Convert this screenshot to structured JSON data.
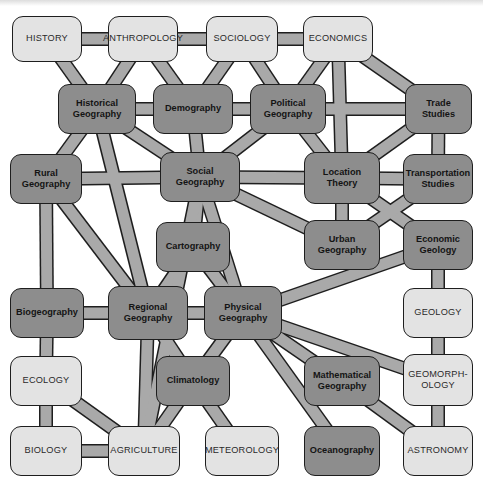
{
  "diagram": {
    "colors": {
      "discipline_box": "#e3e3e3",
      "geography_box": "#8d8d8d",
      "border": "#1e1e1e",
      "link": "#a9a9a9"
    },
    "nodes": {
      "history": {
        "label": "HISTORY",
        "type": "discipline"
      },
      "anthropology": {
        "label": "ANTHROPOLOGY",
        "type": "discipline"
      },
      "sociology": {
        "label": "SOCIOLOGY",
        "type": "discipline"
      },
      "economics": {
        "label": "ECONOMICS",
        "type": "discipline"
      },
      "historical_geography": {
        "label": "Historical\nGeography",
        "type": "geography"
      },
      "demography": {
        "label": "Demography",
        "type": "geography"
      },
      "political_geography": {
        "label": "Political\nGeography",
        "type": "geography"
      },
      "trade_studies": {
        "label": "Trade\nStudies",
        "type": "geography"
      },
      "rural_geography": {
        "label": "Rural\nGeography",
        "type": "geography"
      },
      "social_geography": {
        "label": "Social\nGeography",
        "type": "geography"
      },
      "location_theory": {
        "label": "Location\nTheory",
        "type": "geography"
      },
      "transportation_studies": {
        "label": "Transportation\nStudies",
        "type": "geography"
      },
      "cartography": {
        "label": "Cartography",
        "type": "geography"
      },
      "urban_geography": {
        "label": "Urban\nGeography",
        "type": "geography"
      },
      "economic_geology": {
        "label": "Economic\nGeology",
        "type": "geography"
      },
      "biogeography": {
        "label": "Biogeography",
        "type": "geography"
      },
      "regional_geography": {
        "label": "Regional\nGeography",
        "type": "geography"
      },
      "physical_geography": {
        "label": "Physical\nGeography",
        "type": "geography"
      },
      "geology": {
        "label": "GEOLOGY",
        "type": "discipline"
      },
      "ecology": {
        "label": "ECOLOGY",
        "type": "discipline"
      },
      "climatology": {
        "label": "Climatology",
        "type": "geography"
      },
      "mathematical_geography": {
        "label": "Mathematical\nGeography",
        "type": "geography"
      },
      "geomorphology": {
        "label": "GEOMORPH-\nOLOGY",
        "type": "discipline"
      },
      "biology": {
        "label": "BIOLOGY",
        "type": "discipline"
      },
      "agriculture": {
        "label": "AGRICULTURE",
        "type": "discipline"
      },
      "meteorology": {
        "label": "METEOROLOGY",
        "type": "discipline"
      },
      "oceanography": {
        "label": "Oceanography",
        "type": "geography"
      },
      "astronomy": {
        "label": "ASTRONOMY",
        "type": "discipline"
      }
    },
    "links": [
      [
        "history",
        "anthropology"
      ],
      [
        "anthropology",
        "sociology"
      ],
      [
        "sociology",
        "economics"
      ],
      [
        "history",
        "historical_geography"
      ],
      [
        "anthropology",
        "historical_geography"
      ],
      [
        "anthropology",
        "demography"
      ],
      [
        "sociology",
        "demography"
      ],
      [
        "sociology",
        "political_geography"
      ],
      [
        "economics",
        "political_geography"
      ],
      [
        "economics",
        "location_theory"
      ],
      [
        "economics",
        "trade_studies"
      ],
      [
        "historical_geography",
        "demography"
      ],
      [
        "demography",
        "political_geography"
      ],
      [
        "political_geography",
        "trade_studies"
      ],
      [
        "trade_studies",
        "transportation_studies"
      ],
      [
        "trade_studies",
        "location_theory"
      ],
      [
        "historical_geography",
        "social_geography"
      ],
      [
        "historical_geography",
        "regional_geography"
      ],
      [
        "historical_geography",
        "rural_geography"
      ],
      [
        "demography",
        "social_geography"
      ],
      [
        "political_geography",
        "social_geography"
      ],
      [
        "political_geography",
        "location_theory"
      ],
      [
        "rural_geography",
        "social_geography"
      ],
      [
        "social_geography",
        "location_theory"
      ],
      [
        "location_theory",
        "transportation_studies"
      ],
      [
        "social_geography",
        "cartography"
      ],
      [
        "social_geography",
        "urban_geography"
      ],
      [
        "social_geography",
        "physical_geography"
      ],
      [
        "location_theory",
        "urban_geography"
      ],
      [
        "location_theory",
        "economic_geology"
      ],
      [
        "transportation_studies",
        "urban_geography"
      ],
      [
        "rural_geography",
        "regional_geography"
      ],
      [
        "rural_geography",
        "biogeography"
      ],
      [
        "cartography",
        "regional_geography"
      ],
      [
        "cartography",
        "physical_geography"
      ],
      [
        "regional_geography",
        "physical_geography"
      ],
      [
        "regional_geography",
        "climatology"
      ],
      [
        "physical_geography",
        "climatology"
      ],
      [
        "physical_geography",
        "economic_geology"
      ],
      [
        "physical_geography",
        "geomorphology"
      ],
      [
        "physical_geography",
        "mathematical_geography"
      ],
      [
        "physical_geography",
        "oceanography"
      ],
      [
        "economic_geology",
        "geology"
      ],
      [
        "geology",
        "geomorphology"
      ],
      [
        "biogeography",
        "ecology"
      ],
      [
        "biogeography",
        "regional_geography"
      ],
      [
        "ecology",
        "biology"
      ],
      [
        "ecology",
        "agriculture"
      ],
      [
        "biology",
        "agriculture"
      ],
      [
        "regional_geography",
        "agriculture"
      ],
      [
        "climatology",
        "agriculture"
      ],
      [
        "climatology",
        "meteorology"
      ],
      [
        "mathematical_geography",
        "astronomy"
      ],
      [
        "geomorphology",
        "astronomy"
      ],
      [
        "social_geography",
        "agriculture"
      ]
    ]
  }
}
